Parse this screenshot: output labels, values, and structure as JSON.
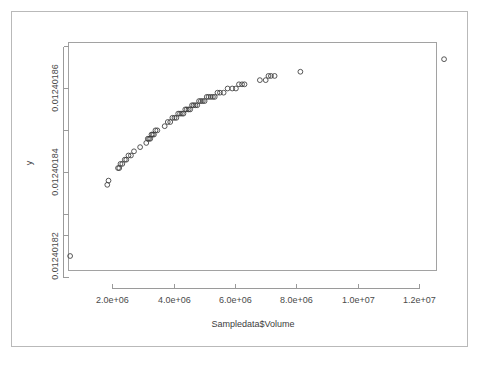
{
  "chart_data": {
    "type": "scatter",
    "title": "",
    "subtitle": "",
    "xlabel": "Sampledata$Volume",
    "ylabel": "y",
    "xlim": [
      300000,
      13300000
    ],
    "ylim": [
      0.012401805,
      0.012401868
    ],
    "xticks": [
      2000000,
      4000000,
      6000000,
      8000000,
      10000000,
      12000000
    ],
    "xticklabels": [
      "2.0e+06",
      "4.0e+06",
      "6.0e+06",
      "8.0e+06",
      "1.0e+07",
      "1.2e+07"
    ],
    "yticks": [
      0.01240182,
      0.01240184,
      0.01240186
    ],
    "yticklabels": [
      "0.01240182",
      "0.01240184",
      "0.01240186"
    ],
    "yminorticks": [
      0.01240181,
      0.01240183,
      0.01240185,
      0.012401867
    ],
    "grid": false,
    "legend": null,
    "legend_position": "none",
    "marker": "open-circle",
    "marker_size": 2.4,
    "marker_color": "#3a3a3a",
    "point_count": 69,
    "points": [
      {
        "x": 620000,
        "y": 0.01240182
      },
      {
        "x": 1830000,
        "y": 0.012401837
      },
      {
        "x": 1870000,
        "y": 0.012401838
      },
      {
        "x": 2180000,
        "y": 0.012401841
      },
      {
        "x": 2220000,
        "y": 0.012401841
      },
      {
        "x": 2260000,
        "y": 0.012401842
      },
      {
        "x": 2320000,
        "y": 0.012401842
      },
      {
        "x": 2400000,
        "y": 0.012401843
      },
      {
        "x": 2450000,
        "y": 0.012401843
      },
      {
        "x": 2520000,
        "y": 0.012401844
      },
      {
        "x": 2600000,
        "y": 0.012401844
      },
      {
        "x": 2700000,
        "y": 0.012401845
      },
      {
        "x": 2900000,
        "y": 0.012401846
      },
      {
        "x": 3100000,
        "y": 0.012401847
      },
      {
        "x": 3150000,
        "y": 0.012401848
      },
      {
        "x": 3190000,
        "y": 0.012401848
      },
      {
        "x": 3230000,
        "y": 0.012401848
      },
      {
        "x": 3270000,
        "y": 0.012401849
      },
      {
        "x": 3310000,
        "y": 0.012401849
      },
      {
        "x": 3350000,
        "y": 0.012401849
      },
      {
        "x": 3400000,
        "y": 0.01240185
      },
      {
        "x": 3460000,
        "y": 0.01240185
      },
      {
        "x": 3700000,
        "y": 0.012401851
      },
      {
        "x": 3800000,
        "y": 0.012401852
      },
      {
        "x": 3880000,
        "y": 0.012401852
      },
      {
        "x": 3950000,
        "y": 0.012401853
      },
      {
        "x": 4020000,
        "y": 0.012401853
      },
      {
        "x": 4080000,
        "y": 0.012401853
      },
      {
        "x": 4140000,
        "y": 0.012401854
      },
      {
        "x": 4200000,
        "y": 0.012401854
      },
      {
        "x": 4260000,
        "y": 0.012401854
      },
      {
        "x": 4310000,
        "y": 0.012401854
      },
      {
        "x": 4370000,
        "y": 0.012401855
      },
      {
        "x": 4420000,
        "y": 0.012401855
      },
      {
        "x": 4480000,
        "y": 0.012401855
      },
      {
        "x": 4530000,
        "y": 0.012401855
      },
      {
        "x": 4590000,
        "y": 0.012401856
      },
      {
        "x": 4640000,
        "y": 0.012401856
      },
      {
        "x": 4700000,
        "y": 0.012401856
      },
      {
        "x": 4760000,
        "y": 0.012401856
      },
      {
        "x": 4820000,
        "y": 0.012401857
      },
      {
        "x": 4880000,
        "y": 0.012401857
      },
      {
        "x": 4940000,
        "y": 0.012401857
      },
      {
        "x": 5000000,
        "y": 0.012401857
      },
      {
        "x": 5070000,
        "y": 0.012401858
      },
      {
        "x": 5130000,
        "y": 0.012401858
      },
      {
        "x": 5200000,
        "y": 0.012401858
      },
      {
        "x": 5270000,
        "y": 0.012401858
      },
      {
        "x": 5330000,
        "y": 0.012401858
      },
      {
        "x": 5420000,
        "y": 0.012401859
      },
      {
        "x": 5500000,
        "y": 0.012401859
      },
      {
        "x": 5620000,
        "y": 0.012401859
      },
      {
        "x": 5750000,
        "y": 0.01240186
      },
      {
        "x": 5900000,
        "y": 0.01240186
      },
      {
        "x": 6020000,
        "y": 0.01240186
      },
      {
        "x": 6120000,
        "y": 0.012401861
      },
      {
        "x": 6220000,
        "y": 0.012401861
      },
      {
        "x": 6300000,
        "y": 0.012401861
      },
      {
        "x": 6800000,
        "y": 0.012401862
      },
      {
        "x": 6990000,
        "y": 0.012401862
      },
      {
        "x": 7080000,
        "y": 0.012401863
      },
      {
        "x": 7160000,
        "y": 0.012401863
      },
      {
        "x": 7280000,
        "y": 0.012401863
      },
      {
        "x": 8120000,
        "y": 0.012401864
      },
      {
        "x": 12800000,
        "y": 0.012401867
      }
    ]
  },
  "axes": {
    "x_axis_label": "Sampledata$Volume",
    "y_axis_label": "y",
    "x_tick_labels": [
      "2.0e+06",
      "4.0e+06",
      "6.0e+06",
      "8.0e+06",
      "1.0e+07",
      "1.2e+07"
    ],
    "y_tick_labels": [
      "0.01240186",
      "0.01240184",
      "0.01240182"
    ]
  }
}
